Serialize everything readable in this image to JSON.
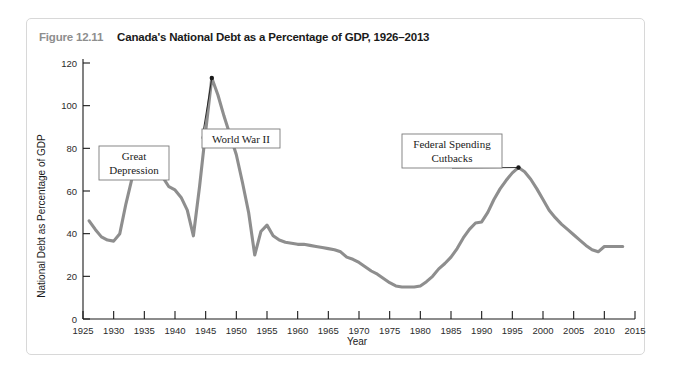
{
  "figure": {
    "number": "Figure 12.11",
    "title": "Canada's National Debt as a Percentage of GDP, 1926–2013"
  },
  "chart_data": {
    "type": "line",
    "title": "Canada's National Debt as a Percentage of GDP, 1926–2013",
    "xlabel": "Year",
    "ylabel": "National Debt as Percentage of GDP",
    "xlim": [
      1925,
      2015
    ],
    "ylim": [
      0,
      120
    ],
    "xticks": [
      1925,
      1930,
      1935,
      1940,
      1945,
      1950,
      1955,
      1960,
      1965,
      1970,
      1975,
      1980,
      1985,
      1990,
      1995,
      2000,
      2005,
      2010,
      2015
    ],
    "yticks": [
      0,
      20,
      40,
      60,
      80,
      100,
      120
    ],
    "grid": false,
    "legend": "none",
    "line_color": "#8e8e8e",
    "series": [
      {
        "name": "National Debt as Percentage of GDP",
        "x": [
          1926,
          1927,
          1928,
          1929,
          1930,
          1931,
          1932,
          1933,
          1934,
          1935,
          1936,
          1937,
          1938,
          1939,
          1940,
          1941,
          1942,
          1943,
          1944,
          1945,
          1946,
          1947,
          1948,
          1949,
          1950,
          1951,
          1952,
          1953,
          1954,
          1955,
          1956,
          1957,
          1958,
          1959,
          1960,
          1961,
          1962,
          1963,
          1964,
          1965,
          1966,
          1967,
          1968,
          1969,
          1970,
          1971,
          1972,
          1973,
          1974,
          1975,
          1976,
          1977,
          1978,
          1979,
          1980,
          1981,
          1982,
          1983,
          1984,
          1985,
          1986,
          1987,
          1988,
          1989,
          1990,
          1991,
          1992,
          1993,
          1994,
          1995,
          1996,
          1997,
          1998,
          1999,
          2000,
          2001,
          2002,
          2003,
          2004,
          2005,
          2006,
          2007,
          2008,
          2009,
          2010,
          2011,
          2012,
          2013
        ],
        "values": [
          46,
          42,
          38.5,
          37,
          36.5,
          40,
          54,
          66,
          74,
          71.5,
          68,
          67,
          66.5,
          62,
          60.5,
          57,
          51,
          39,
          62,
          88,
          113,
          105,
          95,
          86,
          77,
          64,
          50,
          30,
          41,
          44,
          39,
          37,
          36,
          35.5,
          35,
          35,
          34.5,
          34,
          33.5,
          33,
          32.5,
          31.5,
          29,
          28,
          26.5,
          24.5,
          22.5,
          21,
          19,
          17,
          15.5,
          15,
          15,
          15,
          15.5,
          17.5,
          20,
          23.5,
          26,
          29,
          33,
          38,
          42,
          45,
          45.5,
          50,
          56,
          61,
          65,
          68.5,
          71,
          69,
          65.5,
          61,
          56,
          51,
          47.5,
          44.5,
          42,
          39.5,
          37,
          34.5,
          32.5,
          31.5,
          34,
          34,
          34,
          34
        ]
      }
    ],
    "annotations": [
      {
        "label": "Great Depression",
        "lines": [
          "Great",
          "Depression"
        ],
        "target_x": 1933,
        "target_y": 74
      },
      {
        "label": "World War II",
        "lines": [
          "World War II"
        ],
        "target_x": 1946,
        "target_y": 113
      },
      {
        "label": "Federal Spending Cutbacks",
        "lines": [
          "Federal Spending",
          "Cutbacks"
        ],
        "target_x": 1996,
        "target_y": 71
      }
    ]
  }
}
